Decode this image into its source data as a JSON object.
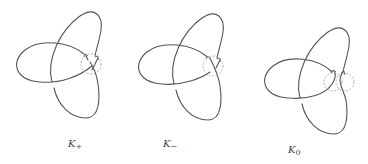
{
  "figure": {
    "stroke_color": "#555555",
    "dashed_circle_color": "#9a9a9a",
    "panels": [
      {
        "id": "k-plus",
        "label_main": "K",
        "label_sub": "+",
        "crossing_type": "positive"
      },
      {
        "id": "k-minus",
        "label_main": "K",
        "label_sub": "−",
        "crossing_type": "negative"
      },
      {
        "id": "k-zero",
        "label_main": "K",
        "label_sub": "0",
        "crossing_type": "smoothed"
      }
    ]
  }
}
